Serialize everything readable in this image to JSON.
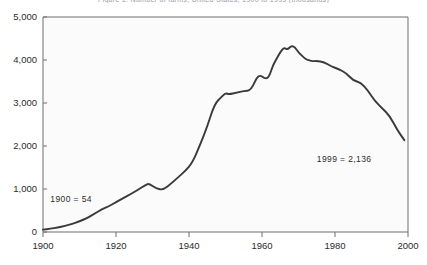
{
  "chart_data": {
    "type": "line",
    "title": "Figure 1. Number of farms, United States, 1900 to 1999 (thousands)",
    "subtitle": "",
    "xlabel": "",
    "ylabel": "",
    "xlim": [
      1900,
      2000
    ],
    "ylim": [
      0,
      5000
    ],
    "grid": false,
    "legend": "none",
    "xticks": [
      "1900",
      "1920",
      "1940",
      "1960",
      "1980",
      "2000"
    ],
    "xtick_values": [
      1900,
      1920,
      1940,
      1960,
      1980,
      2000
    ],
    "yticks": [
      "0",
      "1,000",
      "2,000",
      "3,000",
      "4,000",
      "5,000"
    ],
    "ytick_values": [
      0,
      1000,
      2000,
      3000,
      4000,
      5000
    ],
    "line_color": "#3a3a3a",
    "plot_background": "#fbfbfb",
    "annotations": [
      {
        "text": "1900 = 54",
        "x": 1900,
        "y": 54,
        "label_x": 1902,
        "label_y": 700
      },
      {
        "text": "1999 = 2,136",
        "x": 1999,
        "y": 2136,
        "label_x": 1975,
        "label_y": 1620
      }
    ],
    "series": [
      {
        "name": "Number of farms",
        "x": [
          1900,
          1902,
          1904,
          1906,
          1908,
          1910,
          1912,
          1914,
          1916,
          1918,
          1920,
          1922,
          1924,
          1926,
          1928,
          1929,
          1931,
          1933,
          1935,
          1937,
          1939,
          1941,
          1943,
          1945,
          1947,
          1949,
          1950,
          1951,
          1953,
          1955,
          1957,
          1959,
          1961,
          1962,
          1963,
          1964,
          1965,
          1966,
          1967,
          1968,
          1969,
          1970,
          1971,
          1972,
          1973,
          1974,
          1975,
          1977,
          1979,
          1981,
          1983,
          1985,
          1987,
          1989,
          1991,
          1993,
          1995,
          1997,
          1999
        ],
        "values": [
          54,
          75,
          105,
          140,
          190,
          250,
          320,
          420,
          520,
          600,
          690,
          790,
          880,
          980,
          1090,
          1130,
          1010,
          980,
          1120,
          1270,
          1420,
          1620,
          2020,
          2450,
          2980,
          3150,
          3230,
          3200,
          3240,
          3280,
          3290,
          3680,
          3550,
          3620,
          3880,
          4030,
          4180,
          4290,
          4240,
          4330,
          4300,
          4180,
          4090,
          4020,
          3990,
          3970,
          3980,
          3950,
          3850,
          3790,
          3700,
          3520,
          3480,
          3290,
          3040,
          2870,
          2700,
          2380,
          2136
        ]
      }
    ]
  }
}
